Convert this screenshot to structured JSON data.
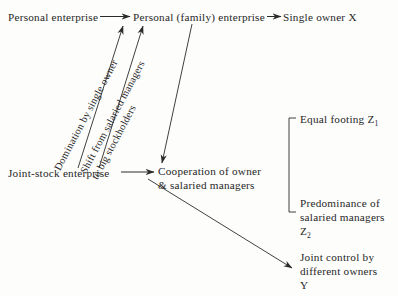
{
  "diagram": {
    "background_color": "#fdfdfc",
    "ink_color": "#262626",
    "nodes": {
      "personal_enterprise": "Personal enterprise",
      "personal_family_enterprise": "Personal (family) enterprise",
      "single_owner": "Single owner X",
      "joint_stock_enterprise": "Joint-stock enterprise",
      "cooperation_line1": "Cooperation of owner",
      "cooperation_line2": "& salaried managers",
      "equal_footing_text": "Equal footing Z",
      "equal_footing_subscript": "1",
      "predominance_line1": "Predominance of",
      "predominance_line2": "salaried managers",
      "predominance_label_text": "Z",
      "predominance_label_subscript": "2",
      "joint_control_line1": "Joint control by",
      "joint_control_line2": "different owners",
      "joint_control_label": "Y"
    },
    "edge_labels": {
      "domination": "Domination by single owner",
      "shift_line1": "Shift from salaried managers",
      "shift_line2": "to big stockholders"
    }
  }
}
